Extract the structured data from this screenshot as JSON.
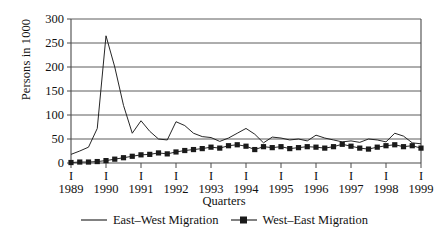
{
  "chart_data": {
    "type": "line",
    "title": "",
    "xlabel": "Quarters",
    "ylabel": "Persons in 1000",
    "ylim": [
      0,
      300
    ],
    "yticks": [
      0,
      50,
      100,
      150,
      200,
      250,
      300
    ],
    "ytick_labels": [
      "0",
      "50",
      "100",
      "150",
      "200",
      "250",
      "300"
    ],
    "grid": "horizontal",
    "legend_position": "bottom-center",
    "x_tick_marker": "I",
    "xtick_labels": [
      "1989",
      "1990",
      "1991",
      "1992",
      "1993",
      "1994",
      "1995",
      "1996",
      "1997",
      "1998",
      "1999"
    ],
    "x_quarters": [
      "1989 I",
      "1989 II",
      "1989 III",
      "1989 IV",
      "1990 I",
      "1990 II",
      "1990 III",
      "1990 IV",
      "1991 I",
      "1991 II",
      "1991 III",
      "1991 IV",
      "1992 I",
      "1992 II",
      "1992 III",
      "1992 IV",
      "1993 I",
      "1993 II",
      "1993 III",
      "1993 IV",
      "1994 I",
      "1994 II",
      "1994 III",
      "1994 IV",
      "1995 I",
      "1995 II",
      "1995 III",
      "1995 IV",
      "1996 I",
      "1996 II",
      "1996 III",
      "1996 IV",
      "1997 I",
      "1997 II",
      "1997 III",
      "1997 IV",
      "1998 I",
      "1998 II",
      "1998 III",
      "1998 IV",
      "1999 I"
    ],
    "series": [
      {
        "name": "East–West Migration",
        "marker": "none",
        "color": "#1a1a1a",
        "values": [
          18,
          25,
          33,
          72,
          265,
          200,
          120,
          62,
          88,
          66,
          50,
          48,
          86,
          78,
          62,
          55,
          53,
          45,
          52,
          62,
          72,
          60,
          42,
          54,
          52,
          48,
          50,
          46,
          58,
          52,
          48,
          44,
          46,
          43,
          50,
          48,
          44,
          62,
          56,
          42,
          40
        ]
      },
      {
        "name": "West–East Migration",
        "marker": "square",
        "color": "#1a1a1a",
        "values": [
          1,
          2,
          2,
          3,
          5,
          8,
          11,
          14,
          17,
          18,
          21,
          19,
          23,
          26,
          28,
          30,
          33,
          31,
          36,
          38,
          35,
          28,
          34,
          32,
          34,
          30,
          32,
          34,
          33,
          31,
          34,
          39,
          35,
          31,
          29,
          33,
          36,
          38,
          34,
          36,
          31
        ]
      }
    ]
  },
  "axes": {
    "y_axis_title": "Persons in 1000",
    "x_axis_title": "Quarters"
  }
}
